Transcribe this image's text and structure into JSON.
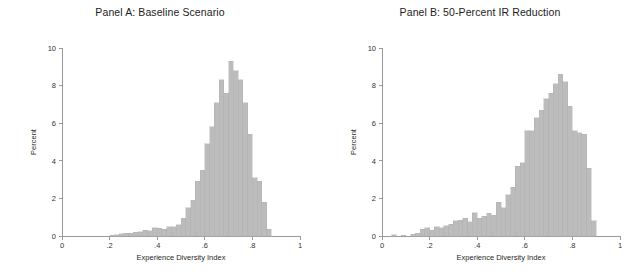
{
  "figure": {
    "background": "#ffffff",
    "bar_color": "#bcbcbc",
    "bar_edge_color": "#b0b0b0",
    "axis_color": "#9a9a9a"
  },
  "panels": [
    {
      "id": "panel-a",
      "title": "Panel A: Baseline Scenario"
    },
    {
      "id": "panel-b",
      "title": "Panel B: 50-Percent IR Reduction"
    }
  ],
  "axes": {
    "xlabel": "Experience Diversity Index",
    "ylabel": "Percent",
    "xticks": [
      "0",
      ".2",
      ".4",
      ".6",
      ".8",
      "1"
    ],
    "xtick_values": [
      0,
      0.2,
      0.4,
      0.6,
      0.8,
      1
    ],
    "yticks": [
      "0",
      "2",
      "4",
      "6",
      "8",
      "10"
    ],
    "ytick_values": [
      0,
      2,
      4,
      6,
      8,
      10
    ],
    "xlim": [
      0,
      1
    ],
    "ylim": [
      0,
      10
    ],
    "grid": false,
    "legend": "none"
  },
  "chart_data": [
    {
      "type": "bar",
      "id": "panel-a",
      "title": "Panel A: Baseline Scenario",
      "xlabel": "Experience Diversity Index",
      "ylabel": "Percent",
      "xlim": [
        0,
        1
      ],
      "ylim": [
        0,
        10
      ],
      "grid": false,
      "legend_position": "none",
      "bin_width": 0.02,
      "bin_centers": [
        0.21,
        0.23,
        0.25,
        0.27,
        0.29,
        0.31,
        0.33,
        0.35,
        0.37,
        0.39,
        0.41,
        0.43,
        0.45,
        0.47,
        0.49,
        0.51,
        0.53,
        0.55,
        0.57,
        0.59,
        0.61,
        0.63,
        0.65,
        0.67,
        0.69,
        0.71,
        0.73,
        0.75,
        0.77,
        0.79,
        0.81,
        0.83,
        0.85,
        0.87
      ],
      "values": [
        0.05,
        0.08,
        0.12,
        0.15,
        0.14,
        0.2,
        0.22,
        0.3,
        0.28,
        0.45,
        0.42,
        0.35,
        0.5,
        0.48,
        0.6,
        0.95,
        1.5,
        1.9,
        2.9,
        3.5,
        4.9,
        5.8,
        7.1,
        8.3,
        7.6,
        9.3,
        8.8,
        8.3,
        7.1,
        5.4,
        3.1,
        2.9,
        1.8,
        0.35
      ]
    },
    {
      "type": "bar",
      "id": "panel-b",
      "title": "Panel B: 50-Percent IR Reduction",
      "xlabel": "Experience Diversity Index",
      "ylabel": "Percent",
      "xlim": [
        0,
        1
      ],
      "ylim": [
        0,
        10
      ],
      "grid": false,
      "legend_position": "none",
      "bin_width": 0.02,
      "bin_centers": [
        0.05,
        0.09,
        0.13,
        0.15,
        0.17,
        0.19,
        0.21,
        0.23,
        0.25,
        0.27,
        0.29,
        0.31,
        0.33,
        0.35,
        0.37,
        0.39,
        0.41,
        0.43,
        0.45,
        0.47,
        0.49,
        0.51,
        0.53,
        0.55,
        0.57,
        0.59,
        0.61,
        0.63,
        0.65,
        0.67,
        0.69,
        0.71,
        0.73,
        0.75,
        0.77,
        0.79,
        0.81,
        0.83,
        0.85,
        0.87,
        0.89
      ],
      "values": [
        0.06,
        0.05,
        0.1,
        0.15,
        0.35,
        0.45,
        0.3,
        0.5,
        0.45,
        0.55,
        0.62,
        0.8,
        0.85,
        0.95,
        0.75,
        1.25,
        0.95,
        1.05,
        1.2,
        1.1,
        1.8,
        1.5,
        2.2,
        2.6,
        3.7,
        3.9,
        5.6,
        5.6,
        6.3,
        6.7,
        7.3,
        7.6,
        8.1,
        8.6,
        8.2,
        6.9,
        5.6,
        5.5,
        5.4,
        3.6,
        0.8
      ]
    }
  ]
}
